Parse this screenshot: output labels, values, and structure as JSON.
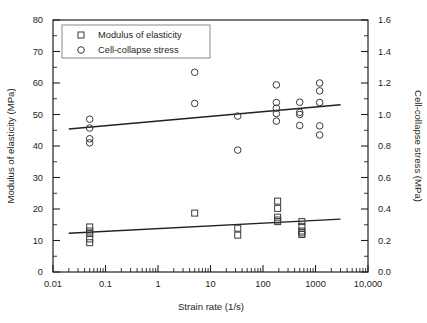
{
  "chart_data": {
    "type": "scatter",
    "title": "",
    "xlabel": "Strain rate (1/s)",
    "ylabel": "Modulus of elasticity (MPa)",
    "y2label": "Cell-collapse stress (MPa)",
    "xscale": "log",
    "xlim": [
      0.01,
      10000
    ],
    "ylim": [
      0,
      80
    ],
    "y2lim": [
      0.0,
      1.6
    ],
    "grid": false,
    "legend_position": "top-left",
    "x_ticks": [
      "0.01",
      "0.1",
      "1",
      "10",
      "100",
      "1000",
      "10,000"
    ],
    "x_tick_values": [
      0.01,
      0.1,
      1,
      10,
      100,
      1000,
      10000
    ],
    "y_ticks": [
      "0",
      "10",
      "20",
      "30",
      "40",
      "50",
      "60",
      "70",
      "80"
    ],
    "y_tick_values": [
      0,
      10,
      20,
      30,
      40,
      50,
      60,
      70,
      80
    ],
    "y_minor_values": [
      5,
      15,
      25,
      35,
      45,
      55,
      65,
      75
    ],
    "y2_ticks": [
      "0.0",
      "0.2",
      "0.4",
      "0.6",
      "0.8",
      "1.0",
      "1.2",
      "1.4",
      "1.6"
    ],
    "y2_tick_values": [
      0.0,
      0.2,
      0.4,
      0.6,
      0.8,
      1.0,
      1.2,
      1.4,
      1.6
    ],
    "y2_minor_values": [
      0.1,
      0.3,
      0.5,
      0.7,
      0.9,
      1.1,
      1.3,
      1.5
    ],
    "series": [
      {
        "name": "Modulus of elasticity",
        "marker": "square",
        "axis": "left",
        "unit": "MPa",
        "points": [
          {
            "x": 0.05,
            "y": 14.3
          },
          {
            "x": 0.05,
            "y": 13.0
          },
          {
            "x": 0.05,
            "y": 12.2
          },
          {
            "x": 0.05,
            "y": 10.5
          },
          {
            "x": 0.05,
            "y": 9.3
          },
          {
            "x": 5.0,
            "y": 18.7
          },
          {
            "x": 33.0,
            "y": 13.9
          },
          {
            "x": 33.0,
            "y": 11.7
          },
          {
            "x": 190.0,
            "y": 22.5
          },
          {
            "x": 190.0,
            "y": 20.2
          },
          {
            "x": 190.0,
            "y": 17.4
          },
          {
            "x": 190.0,
            "y": 16.5
          },
          {
            "x": 190.0,
            "y": 16.0
          },
          {
            "x": 550.0,
            "y": 16.0
          },
          {
            "x": 550.0,
            "y": 14.5
          },
          {
            "x": 550.0,
            "y": 13.0
          },
          {
            "x": 550.0,
            "y": 12.4
          },
          {
            "x": 550.0,
            "y": 11.9
          }
        ],
        "trendline": {
          "x1": 0.02,
          "y1": 12.3,
          "x2": 3000,
          "y2": 16.8
        }
      },
      {
        "name": "Cell-collapse stress",
        "marker": "circle",
        "axis": "right",
        "unit": "MPa",
        "points": [
          {
            "x": 0.05,
            "y": 48.5
          },
          {
            "x": 0.05,
            "y": 45.7
          },
          {
            "x": 0.05,
            "y": 42.3
          },
          {
            "x": 0.05,
            "y": 41.0
          },
          {
            "x": 5.0,
            "y": 63.4
          },
          {
            "x": 5.0,
            "y": 53.5
          },
          {
            "x": 33.0,
            "y": 49.5
          },
          {
            "x": 33.0,
            "y": 38.7
          },
          {
            "x": 180.0,
            "y": 59.4
          },
          {
            "x": 180.0,
            "y": 53.8
          },
          {
            "x": 180.0,
            "y": 52.0
          },
          {
            "x": 180.0,
            "y": 50.3
          },
          {
            "x": 180.0,
            "y": 47.9
          },
          {
            "x": 500.0,
            "y": 53.9
          },
          {
            "x": 500.0,
            "y": 50.7
          },
          {
            "x": 500.0,
            "y": 50.0
          },
          {
            "x": 500.0,
            "y": 46.5
          },
          {
            "x": 1200.0,
            "y": 60.0
          },
          {
            "x": 1200.0,
            "y": 57.5
          },
          {
            "x": 1200.0,
            "y": 53.8
          },
          {
            "x": 1200.0,
            "y": 46.4
          },
          {
            "x": 1200.0,
            "y": 43.5
          }
        ],
        "trendline": {
          "x1": 0.02,
          "y1": 45.4,
          "x2": 3000,
          "y2": 53.1
        }
      }
    ],
    "legend": [
      {
        "label": "Modulus of elasticity",
        "marker": "square"
      },
      {
        "label": "Cell-collapse stress",
        "marker": "circle"
      }
    ]
  }
}
